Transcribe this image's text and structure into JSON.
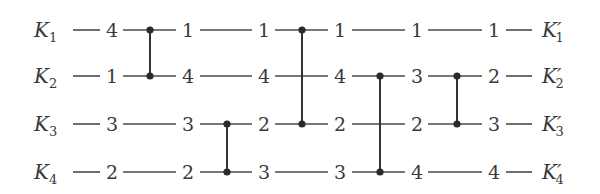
{
  "inputs": [
    {
      "name": "K",
      "sub": "1"
    },
    {
      "name": "K",
      "sub": "2"
    },
    {
      "name": "K",
      "sub": "3"
    },
    {
      "name": "K",
      "sub": "4"
    }
  ],
  "outputs": [
    {
      "name": "K′",
      "sub": "1"
    },
    {
      "name": "K′",
      "sub": "2"
    },
    {
      "name": "K′",
      "sub": "3"
    },
    {
      "name": "K′",
      "sub": "4"
    }
  ],
  "stages": [
    {
      "values": [
        "4",
        "1",
        "3",
        "2"
      ]
    },
    {
      "values": [
        "1",
        "4",
        "3",
        "2"
      ]
    },
    {
      "values": [
        "1",
        "4",
        "2",
        "3"
      ]
    },
    {
      "values": [
        "1",
        "4",
        "2",
        "3"
      ]
    },
    {
      "values": [
        "1",
        "3",
        "2",
        "4"
      ]
    },
    {
      "values": [
        "1",
        "2",
        "3",
        "4"
      ]
    }
  ],
  "comparators": [
    {
      "from_row": 1,
      "to_row": 2,
      "label": "compare K1-K2"
    },
    {
      "from_row": 3,
      "to_row": 4,
      "label": "compare K3-K4"
    },
    {
      "from_row": 1,
      "to_row": 3,
      "label": "compare K1-K3"
    },
    {
      "from_row": 2,
      "to_row": 4,
      "label": "compare K2-K4"
    },
    {
      "from_row": 2,
      "to_row": 3,
      "label": "compare K2-K3"
    }
  ],
  "colors": {
    "wire": "#4a4a4a",
    "comparator": "#333333",
    "text": "#3a3a3a",
    "background": "#ffffff"
  }
}
